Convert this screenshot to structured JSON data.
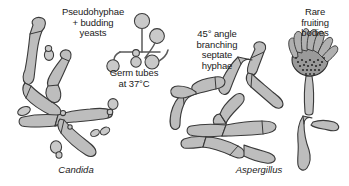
{
  "figure": {
    "background_color": "#ffffff",
    "ink_color": "#1a1a1a",
    "cell_fill_color": "#bdbdbd",
    "cell_outline_color": "#3a3a3a",
    "spore_color": "#2b2b2b"
  },
  "panels": [
    {
      "id": "candida",
      "caption": "Candida",
      "annotations": [
        {
          "id": "pseudohyphae",
          "text": "Pseudohyphae\n+ budding\nyeasts"
        },
        {
          "id": "germ-tubes",
          "text": "Germ tubes\nat 37°C"
        }
      ],
      "features": [
        "pseudohyphae",
        "budding yeasts",
        "germ tubes",
        "blastoconidia"
      ]
    },
    {
      "id": "aspergillus",
      "caption": "Aspergillus",
      "annotations": [
        {
          "id": "septate-hyphae",
          "text": "45° angle\nbranching\nseptate\nhyphae"
        },
        {
          "id": "fruiting-bodies",
          "text": "Rare\nfruiting\nbodies"
        }
      ],
      "features": [
        "septate hyphae",
        "acute angle branching",
        "conidiophore",
        "vesicle",
        "phialides",
        "conidia"
      ]
    }
  ]
}
